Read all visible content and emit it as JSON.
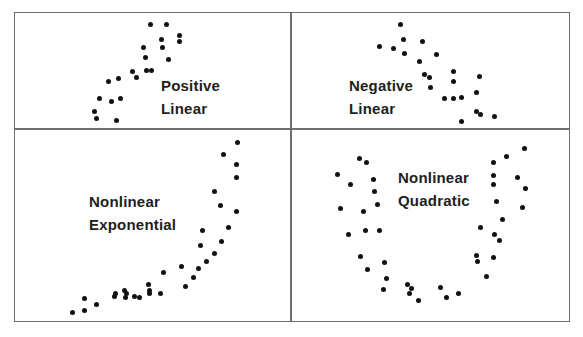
{
  "chart_data": [
    {
      "type": "scatter",
      "title": "Positive Linear",
      "label_lines": [
        "Positive",
        "Linear"
      ],
      "label_pos": [
        161,
        74
      ],
      "points": [
        [
          150,
          24
        ],
        [
          166,
          24
        ],
        [
          179,
          35
        ],
        [
          179,
          41
        ],
        [
          161,
          39
        ],
        [
          162,
          47
        ],
        [
          143,
          47
        ],
        [
          145,
          57
        ],
        [
          168,
          59
        ],
        [
          146,
          70
        ],
        [
          151,
          70
        ],
        [
          132,
          71
        ],
        [
          136,
          77
        ],
        [
          118,
          78
        ],
        [
          108,
          81
        ],
        [
          99,
          98
        ],
        [
          120,
          98
        ],
        [
          111,
          101
        ],
        [
          94,
          111
        ],
        [
          96,
          118
        ],
        [
          116,
          120
        ]
      ]
    },
    {
      "type": "scatter",
      "title": "Negative Linear",
      "label_lines": [
        "Negative",
        "Linear"
      ],
      "label_pos": [
        349,
        74
      ],
      "points": [
        [
          400,
          24
        ],
        [
          403,
          39
        ],
        [
          422,
          41
        ],
        [
          379,
          46
        ],
        [
          393,
          48
        ],
        [
          404,
          53
        ],
        [
          436,
          54
        ],
        [
          419,
          61
        ],
        [
          424,
          74
        ],
        [
          429,
          77
        ],
        [
          453,
          71
        ],
        [
          479,
          76
        ],
        [
          430,
          87
        ],
        [
          453,
          81
        ],
        [
          476,
          92
        ],
        [
          444,
          98
        ],
        [
          453,
          98
        ],
        [
          461,
          97
        ],
        [
          476,
          111
        ],
        [
          480,
          114
        ],
        [
          494,
          116
        ],
        [
          461,
          121
        ]
      ]
    },
    {
      "type": "scatter",
      "title": "Nonlinear Exponential",
      "label_lines": [
        "Nonlinear",
        "Exponential"
      ],
      "label_pos": [
        89,
        190
      ],
      "points": [
        [
          237,
          142
        ],
        [
          223,
          154
        ],
        [
          236,
          164
        ],
        [
          236,
          177
        ],
        [
          214,
          191
        ],
        [
          220,
          205
        ],
        [
          236,
          211
        ],
        [
          228,
          227
        ],
        [
          202,
          230
        ],
        [
          221,
          241
        ],
        [
          200,
          245
        ],
        [
          214,
          253
        ],
        [
          206,
          261
        ],
        [
          198,
          268
        ],
        [
          193,
          277
        ],
        [
          181,
          266
        ],
        [
          185,
          286
        ],
        [
          163,
          272
        ],
        [
          149,
          293
        ],
        [
          148,
          284
        ],
        [
          125,
          297
        ],
        [
          124,
          290
        ],
        [
          114,
          296
        ],
        [
          115,
          293
        ],
        [
          126,
          293
        ],
        [
          134,
          296
        ],
        [
          139,
          297
        ],
        [
          149,
          290
        ],
        [
          160,
          293
        ],
        [
          96,
          304
        ],
        [
          84,
          298
        ],
        [
          84,
          310
        ],
        [
          72,
          312
        ]
      ]
    },
    {
      "type": "scatter",
      "title": "Nonlinear Quadratic",
      "label_lines": [
        "Nonlinear",
        "Quadratic"
      ],
      "label_pos": [
        398,
        166
      ],
      "points": [
        [
          359,
          158
        ],
        [
          366,
          162
        ],
        [
          337,
          174
        ],
        [
          373,
          179
        ],
        [
          350,
          184
        ],
        [
          374,
          191
        ],
        [
          340,
          208
        ],
        [
          377,
          204
        ],
        [
          363,
          211
        ],
        [
          348,
          234
        ],
        [
          365,
          230
        ],
        [
          379,
          230
        ],
        [
          360,
          256
        ],
        [
          367,
          269
        ],
        [
          384,
          262
        ],
        [
          386,
          278
        ],
        [
          383,
          289
        ],
        [
          407,
          284
        ],
        [
          411,
          288
        ],
        [
          409,
          293
        ],
        [
          418,
          300
        ],
        [
          440,
          287
        ],
        [
          446,
          297
        ],
        [
          458,
          293
        ],
        [
          486,
          276
        ],
        [
          476,
          255
        ],
        [
          477,
          261
        ],
        [
          493,
          257
        ],
        [
          480,
          227
        ],
        [
          494,
          234
        ],
        [
          499,
          240
        ],
        [
          502,
          219
        ],
        [
          496,
          201
        ],
        [
          522,
          207
        ],
        [
          493,
          184
        ],
        [
          525,
          188
        ],
        [
          493,
          175
        ],
        [
          517,
          177
        ],
        [
          493,
          162
        ],
        [
          506,
          156
        ],
        [
          524,
          148
        ]
      ]
    }
  ],
  "panels": {
    "top_left": {
      "line1": "Positive",
      "line2": "Linear"
    },
    "top_right": {
      "line1": "Negative",
      "line2": "Linear"
    },
    "bottom_left": {
      "line1": "Nonlinear",
      "line2": "Exponential"
    },
    "bottom_right": {
      "line1": "Nonlinear",
      "line2": "Quadratic"
    }
  },
  "colors": {
    "dot": "#111111",
    "border": "#6e6e6e",
    "text": "#1e1e1e"
  }
}
